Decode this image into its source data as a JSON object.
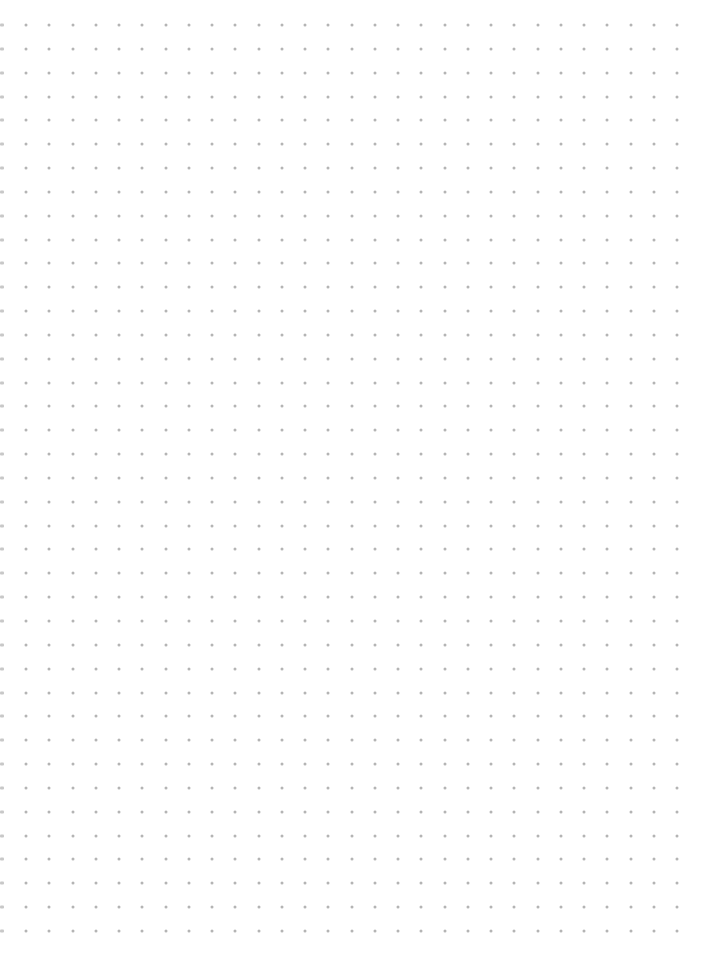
{
  "page": {
    "type": "dot-grid-paper",
    "background": "#ffffff",
    "dot_color": "#b4b4b4",
    "edge_mark_color": "#c8c8c8"
  },
  "grid": {
    "first_x": 26,
    "first_y": 25,
    "spacing_x": 23.25,
    "spacing_y": 23.84,
    "columns": 29,
    "rows": 39,
    "edge_mark_x": 2
  }
}
